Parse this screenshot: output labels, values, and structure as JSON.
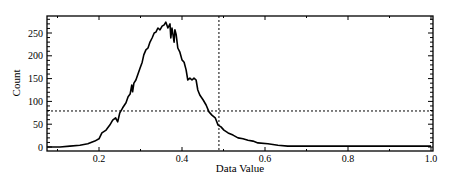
{
  "chart_data": {
    "type": "line",
    "title": "",
    "xlabel": "Data Value",
    "ylabel": "Count",
    "xlim": [
      0.075,
      1.0
    ],
    "ylim": [
      -8,
      287
    ],
    "xticks": [
      0.2,
      0.4,
      0.6,
      0.8,
      1.0
    ],
    "xtick_labels": [
      "0.2",
      "0.4",
      "0.6",
      "0.8",
      "1.0"
    ],
    "yticks": [
      0,
      50,
      100,
      150,
      200,
      250
    ],
    "ytick_labels": [
      "0",
      "50",
      "100",
      "150",
      "200",
      "250"
    ],
    "grid": false,
    "legend": null,
    "series": [
      {
        "name": "histogram",
        "color": "#000000",
        "x": [
          0.075,
          0.106,
          0.13,
          0.154,
          0.173,
          0.19,
          0.2,
          0.207,
          0.217,
          0.226,
          0.233,
          0.24,
          0.245,
          0.25,
          0.257,
          0.265,
          0.27,
          0.275,
          0.279,
          0.281,
          0.284,
          0.289,
          0.294,
          0.299,
          0.304,
          0.308,
          0.313,
          0.318,
          0.323,
          0.328,
          0.333,
          0.337,
          0.342,
          0.347,
          0.352,
          0.357,
          0.361,
          0.366,
          0.371,
          0.373,
          0.376,
          0.381,
          0.383,
          0.386,
          0.39,
          0.395,
          0.4,
          0.405,
          0.41,
          0.414,
          0.419,
          0.424,
          0.429,
          0.434,
          0.438,
          0.443,
          0.451,
          0.458,
          0.465,
          0.472,
          0.48,
          0.487,
          0.494,
          0.501,
          0.511,
          0.523,
          0.535,
          0.547,
          0.559,
          0.571,
          0.583,
          0.607,
          0.631,
          0.655,
          0.684,
          0.73,
          0.802,
          0.875,
          0.923,
          1.0
        ],
        "y": [
          0,
          0,
          2,
          4,
          7,
          13,
          18,
          31,
          37,
          48,
          59,
          64,
          55,
          75,
          86,
          97,
          110,
          116,
          136,
          121,
          140,
          147,
          160,
          173,
          186,
          202,
          213,
          217,
          230,
          239,
          250,
          252,
          261,
          257,
          265,
          268,
          274,
          261,
          270,
          239,
          261,
          230,
          257,
          246,
          217,
          208,
          191,
          186,
          169,
          147,
          151,
          147,
          151,
          147,
          125,
          114,
          103,
          92,
          77,
          70,
          64,
          48,
          44,
          37,
          31,
          26,
          20,
          18,
          15,
          13,
          9,
          7,
          4,
          2,
          2,
          2,
          2,
          2,
          2,
          2
        ]
      }
    ],
    "reference_lines": [
      {
        "orientation": "vertical",
        "x": 0.489,
        "style": "dotted"
      },
      {
        "orientation": "horizontal",
        "y": 79,
        "style": "dotted"
      }
    ]
  }
}
